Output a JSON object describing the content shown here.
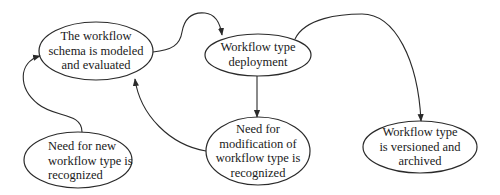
{
  "diagram": {
    "type": "flow",
    "stroke_color": "#2a2a2a",
    "background": "#ffffff",
    "nodes": [
      {
        "id": "schema",
        "lines": [
          "The workflow",
          "schema is modeled",
          "and evaluated"
        ]
      },
      {
        "id": "deployment",
        "lines": [
          "Workflow type",
          "deployment"
        ]
      },
      {
        "id": "need-new",
        "lines": [
          "Need for new",
          "workflow type is",
          "recognized"
        ]
      },
      {
        "id": "need-modification",
        "lines": [
          "Need for",
          "modification of",
          "workflow type is",
          "recognized"
        ]
      },
      {
        "id": "versioned",
        "lines": [
          "Workflow type",
          "is versioned and",
          "archived"
        ]
      }
    ],
    "edges": [
      {
        "from": "need-new",
        "to": "schema"
      },
      {
        "from": "schema",
        "to": "deployment"
      },
      {
        "from": "deployment",
        "to": "need-modification"
      },
      {
        "from": "need-modification",
        "to": "schema"
      },
      {
        "from": "deployment",
        "to": "versioned"
      }
    ]
  }
}
